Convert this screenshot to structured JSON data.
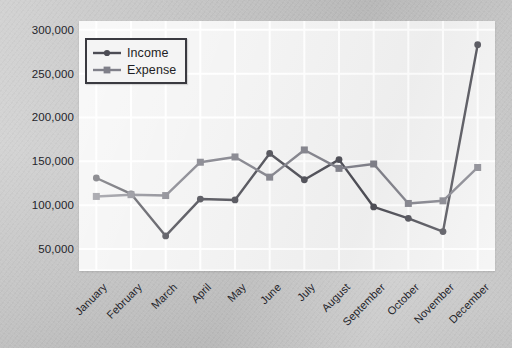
{
  "chart_data": {
    "type": "line",
    "title": "",
    "xlabel": "",
    "ylabel": "",
    "categories": [
      "January",
      "February",
      "March",
      "April",
      "May",
      "June",
      "July",
      "August",
      "September",
      "October",
      "November",
      "December"
    ],
    "series": [
      {
        "name": "Income",
        "color": "#4d4d55",
        "marker": "circle",
        "values": [
          131000,
          113000,
          65000,
          107000,
          106000,
          159000,
          129000,
          152000,
          98000,
          85000,
          70000,
          283000
        ]
      },
      {
        "name": "Expense",
        "color": "#808089",
        "marker": "square",
        "values": [
          110000,
          112000,
          111000,
          149000,
          155000,
          132000,
          163000,
          142000,
          147000,
          102000,
          105000,
          143000
        ]
      }
    ],
    "ylim": [
      25000,
      310000
    ],
    "yticks": [
      50000,
      100000,
      150000,
      200000,
      250000,
      300000
    ],
    "ytick_labels": [
      "50,000",
      "100,000",
      "150,000",
      "200,000",
      "250,000",
      "300,000"
    ],
    "grid": true,
    "grid_color": "#ffffff",
    "legend_position": "upper-left",
    "plot_background": "#f2f2f2",
    "figure_background": "#c6c6c6"
  }
}
